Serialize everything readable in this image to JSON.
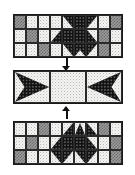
{
  "figure": {
    "title": "",
    "background": "#ffffff",
    "width": 135,
    "height": 175
  },
  "palette": {
    "light": "#f4f4f2",
    "gray": "#9a9a9a",
    "dark": "#121212",
    "border": "#1a1a1a",
    "arrow": "#111111"
  },
  "legend": {
    "light_label": "light stipple",
    "gray_label": "medium gray check",
    "dark_label": "dark dotted"
  },
  "panels": [
    {
      "id": "panel-top",
      "name": "top-quilt-panel",
      "motif": "down-chevron",
      "columns": 9,
      "rows": 3,
      "x": 13,
      "y": 14,
      "width": 110,
      "height": 44,
      "cells": [
        [
          "gray",
          "light",
          "light",
          "light",
          "dark-tr",
          "dark",
          "dark-tl",
          "light",
          "light"
        ],
        [
          "light",
          "gray",
          "light",
          "dark-br",
          "dark",
          "dark",
          "dark",
          "gray",
          "light"
        ],
        [
          "light",
          "light",
          "gray",
          "light",
          "dark-br",
          "dark",
          "dark-bl",
          "light",
          "light"
        ]
      ],
      "cells_note": "row3 outer: gray at col3 and col7 mirrored"
    },
    {
      "id": "panel-middle",
      "name": "middle-quilt-panel",
      "motif": "opposing-arrows",
      "columns": 3,
      "rows": 1,
      "x": 13,
      "y": 70,
      "width": 110,
      "height": 34,
      "cells": [
        [
          "dark-right-arrow",
          "light",
          "dark-left-arrow"
        ]
      ]
    },
    {
      "id": "panel-bottom",
      "name": "bottom-quilt-panel",
      "motif": "up-chevron",
      "columns": 9,
      "rows": 3,
      "x": 13,
      "y": 121,
      "width": 110,
      "height": 44,
      "cells": [
        [
          "light",
          "light",
          "gray",
          "light",
          "dark-tr",
          "dark",
          "dark-tl",
          "gray",
          "light"
        ],
        [
          "light",
          "gray",
          "light",
          "dark-tr",
          "dark",
          "dark",
          "dark",
          "light",
          "gray"
        ],
        [
          "gray",
          "light",
          "light",
          "light",
          "dark-br",
          "dark",
          "dark-bl",
          "light",
          "light"
        ]
      ]
    }
  ],
  "arrows": [
    {
      "id": "arrow-top-to-middle",
      "name": "arrow-down-top-to-middle",
      "direction": "down",
      "from": "panel-top",
      "to": "panel-middle",
      "x": 62,
      "y": 58,
      "length": 13
    },
    {
      "id": "arrow-bottom-to-middle",
      "name": "arrow-up-bottom-to-middle",
      "direction": "up",
      "from": "panel-bottom",
      "to": "panel-middle",
      "x": 62,
      "y": 105,
      "length": 14
    }
  ]
}
